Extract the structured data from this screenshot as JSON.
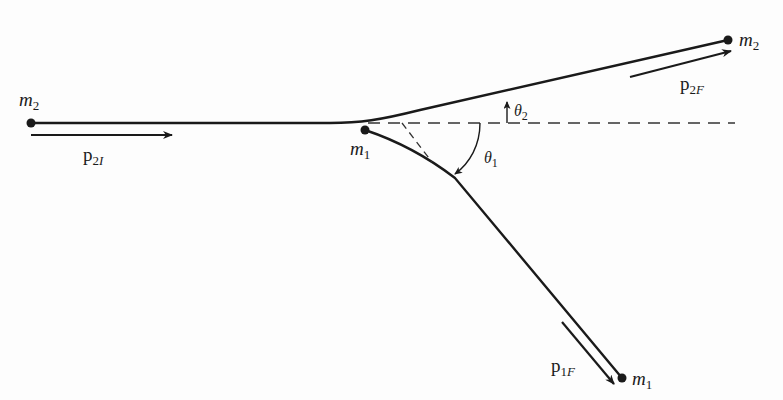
{
  "figure": {
    "colors": {
      "ink": "#1a1a1a",
      "background": "#fdfdfd"
    }
  },
  "labels": {
    "m2_initial": {
      "symbol": "m",
      "sub": "2"
    },
    "m1_initial": {
      "symbol": "m",
      "sub": "1"
    },
    "m2_final": {
      "symbol": "m",
      "sub": "2"
    },
    "m1_final": {
      "symbol": "m",
      "sub": "1"
    },
    "p2I": {
      "symbol": "p",
      "sub_num": "2",
      "sub_letter": "I"
    },
    "p2F": {
      "symbol": "p",
      "sub_num": "2",
      "sub_letter": "F"
    },
    "p1F": {
      "symbol": "p",
      "sub_num": "1",
      "sub_letter": "F"
    },
    "theta2": {
      "symbol": "θ",
      "sub": "2"
    },
    "theta1": {
      "symbol": "θ",
      "sub": "1"
    }
  }
}
